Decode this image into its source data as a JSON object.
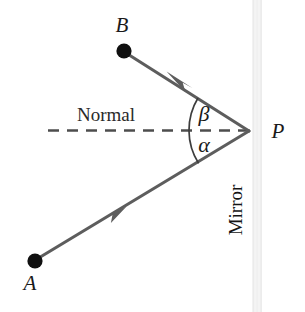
{
  "figure": {
    "background_color": "#ffffff",
    "ray_color": "#595959",
    "dot_color": "#111111",
    "normal_line_color": "#4d4d4d",
    "mirror_band_color": "#f2f2f2",
    "labels": {
      "source_point": "A",
      "target_point": "B",
      "reflection_point": "P",
      "normal": "Normal",
      "mirror": "Mirror",
      "angle_incidence": "α",
      "angle_reflection": "β"
    },
    "geometry": {
      "point_a": {
        "x": 35,
        "y": 261
      },
      "point_b": {
        "x": 124,
        "y": 52
      },
      "point_p": {
        "x": 250,
        "y": 131
      },
      "normal_line": {
        "x1": 48,
        "y1": 130,
        "x2": 250,
        "y2": 130
      },
      "mirror_band": {
        "x": 253,
        "y": 0,
        "width": 9,
        "height": 312
      },
      "incident_arrow": {
        "x": 115,
        "y": 214
      },
      "reflected_arrow": {
        "x": 180,
        "y": 79
      },
      "angle_arc_radius": 62
    }
  }
}
